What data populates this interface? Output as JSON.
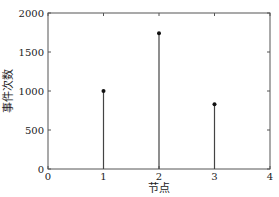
{
  "chart_data": {
    "type": "stem",
    "title": "",
    "xlabel": "节点",
    "ylabel": "事件次数",
    "x": [
      1,
      2,
      3
    ],
    "values": [
      1000,
      1740,
      830
    ],
    "xlim": [
      0,
      4
    ],
    "ylim": [
      0,
      2000
    ],
    "xticks": [
      "0",
      "1",
      "2",
      "3",
      "4"
    ],
    "yticks": [
      "0",
      "500",
      "1000",
      "1500",
      "2000"
    ],
    "grid": false,
    "legend": null
  }
}
